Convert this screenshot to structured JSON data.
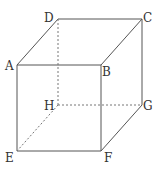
{
  "diagram": {
    "title": "",
    "type": "cube",
    "vertices": {
      "A": {
        "label": "A",
        "x": 17,
        "y": 65
      },
      "B": {
        "label": "B",
        "x": 101,
        "y": 65
      },
      "C": {
        "label": "C",
        "x": 142,
        "y": 19
      },
      "D": {
        "label": "D",
        "x": 58,
        "y": 19
      },
      "E": {
        "label": "E",
        "x": 17,
        "y": 151
      },
      "F": {
        "label": "F",
        "x": 101,
        "y": 151
      },
      "G": {
        "label": "G",
        "x": 142,
        "y": 105
      },
      "H": {
        "label": "H",
        "x": 58,
        "y": 105
      }
    },
    "solid_edges": [
      "AB",
      "BC",
      "CD",
      "DA",
      "AE",
      "BF",
      "CG",
      "EF",
      "FG"
    ],
    "hidden_edges": [
      "DH",
      "HE",
      "HG"
    ],
    "line_color": "#555555"
  }
}
